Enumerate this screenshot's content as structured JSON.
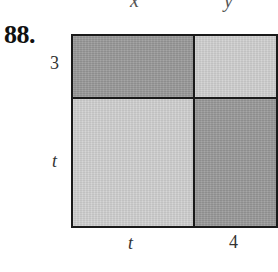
{
  "header": {
    "cropped_glyphs": [
      {
        "text": "x",
        "left": 130,
        "top": -10
      },
      {
        "text": "y",
        "left": 224,
        "top": -10
      }
    ]
  },
  "problem": {
    "number": "88."
  },
  "diagram": {
    "type": "area-model",
    "left_labels": [
      "3",
      "t"
    ],
    "bottom_labels": [
      "t",
      "4"
    ],
    "cells": [
      {
        "position": "top-left",
        "width": "t",
        "height": "3",
        "shade": "dark",
        "color": "#9b9b9b"
      },
      {
        "position": "top-right",
        "width": "4",
        "height": "3",
        "shade": "light",
        "color": "#cfcfcf"
      },
      {
        "position": "bottom-left",
        "width": "t",
        "height": "t",
        "shade": "light",
        "color": "#cfcfcf"
      },
      {
        "position": "bottom-right",
        "width": "4",
        "height": "t",
        "shade": "dark",
        "color": "#9b9b9b"
      }
    ],
    "border_color": "#1a1a1a"
  }
}
